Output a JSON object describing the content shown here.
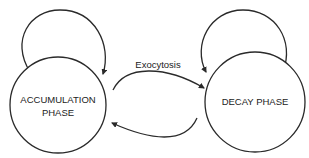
{
  "diagram": {
    "type": "state-diagram",
    "states": [
      {
        "id": "accumulation",
        "label_lines": [
          "ACCUMULATION",
          "PHASE"
        ]
      },
      {
        "id": "decay",
        "label_lines": [
          "DECAY PHASE"
        ]
      }
    ],
    "transitions": [
      {
        "from": "accumulation",
        "to": "accumulation",
        "label": ""
      },
      {
        "from": "decay",
        "to": "decay",
        "label": ""
      },
      {
        "from": "accumulation",
        "to": "decay",
        "label": "Exocytosis"
      },
      {
        "from": "decay",
        "to": "accumulation",
        "label": ""
      }
    ],
    "colors": {
      "stroke": "#2a2a2a",
      "text": "#222222",
      "background": "#ffffff"
    }
  }
}
